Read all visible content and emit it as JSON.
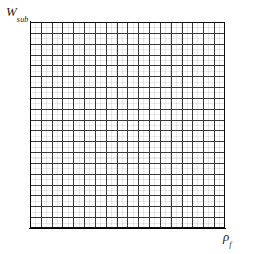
{
  "figure": {
    "kind": "empty-grid-plot",
    "background_color": "#ffffff",
    "grid_line_color": "#3a3a3a",
    "frame_color": "#101010",
    "minor_line_color": "#9e9e9e"
  },
  "axes": {
    "y": {
      "label_base": "W",
      "label_sub": "sub",
      "tick_labels": [],
      "show_ticks": false
    },
    "x": {
      "label_base": "ρ",
      "label_sub": "f",
      "tick_labels": [],
      "show_ticks": false
    }
  },
  "chart_data": {
    "type": "line",
    "title": "",
    "xlabel": "ρ_f",
    "ylabel": "W_sub",
    "x": [],
    "series": [],
    "categories": [],
    "values": [],
    "xlim": [
      0,
      18
    ],
    "ylim": [
      0,
      19
    ],
    "grid": true,
    "grid_columns": 18,
    "grid_rows": 19,
    "legend": "none",
    "annotations": [],
    "tick_labels_x": [],
    "tick_labels_y": [],
    "note": "Empty axes: grid only, no plotted data, no numeric tick labels."
  }
}
